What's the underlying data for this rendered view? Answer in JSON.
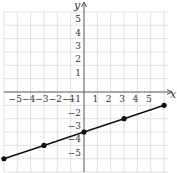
{
  "chart_data": {
    "type": "line",
    "title": "",
    "xlabel": "x",
    "ylabel": "y",
    "xlim": [
      -6,
      6
    ],
    "ylim": [
      -6,
      6
    ],
    "grid": true,
    "x_tick_labels": [
      "-5",
      "-4",
      "-3",
      "-2",
      "-1",
      "1",
      "2",
      "3",
      "4",
      "5"
    ],
    "y_tick_labels": [
      "5",
      "4",
      "3",
      "2",
      "1",
      "-1",
      "-2",
      "-3",
      "-4",
      "-5"
    ],
    "series": [
      {
        "name": "line",
        "points": [
          [
            -6,
            -5
          ],
          [
            -3,
            -4
          ],
          [
            0,
            -3
          ],
          [
            3,
            -2
          ],
          [
            6,
            -1
          ]
        ],
        "color": "#111111",
        "markers": true
      }
    ]
  },
  "colors": {
    "grid": "#d9d9d9",
    "axis": "#555555",
    "line": "#111111"
  }
}
